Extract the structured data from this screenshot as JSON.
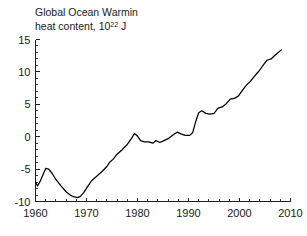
{
  "chart_data": {
    "type": "line",
    "title": "Global Ocean Warmin",
    "subtitle": "heat content, 10",
    "subtitle_exponent": "22",
    "subtitle_unit": " J",
    "xlabel": "",
    "ylabel": "",
    "xlim": [
      1960,
      2010
    ],
    "ylim": [
      -10,
      15
    ],
    "grid": false,
    "legend": null,
    "line_color": "#000000",
    "background_color": "#ffffff",
    "axis_color": "#222222",
    "x_major_ticks": [
      1960,
      1970,
      1980,
      1990,
      2000,
      2010
    ],
    "x_major_tick_labels": [
      "1960",
      "1970",
      "1980",
      "1990",
      "2000",
      "2010"
    ],
    "x_minor_tick_step": 2,
    "y_major_ticks": [
      -10,
      -5,
      0,
      5,
      10,
      15
    ],
    "y_major_tick_labels": [
      "-10",
      "-5",
      "0",
      "5",
      "10",
      "15"
    ],
    "y_minor_tick_step": 1,
    "series": [
      {
        "name": "Global ocean heat content anomaly",
        "x": [
          1960.0,
          1960.4,
          1960.9,
          1961.4,
          1962.0,
          1962.6,
          1963.2,
          1964.0,
          1965.0,
          1966.0,
          1967.0,
          1967.6,
          1968.2,
          1968.8,
          1969.5,
          1970.2,
          1971.0,
          1972.0,
          1973.0,
          1974.0,
          1974.6,
          1975.2,
          1976.0,
          1977.0,
          1978.0,
          1978.8,
          1979.4,
          1980.0,
          1980.6,
          1981.4,
          1982.2,
          1983.0,
          1983.6,
          1984.4,
          1985.2,
          1986.0,
          1987.0,
          1987.8,
          1988.6,
          1989.4,
          1990.2,
          1990.8,
          1991.4,
          1992.0,
          1992.6,
          1993.4,
          1994.2,
          1995.0,
          1995.8,
          1996.6,
          1997.4,
          1998.2,
          1999.0,
          1999.8,
          2000.6,
          2001.4,
          2002.2,
          2003.0,
          2003.8,
          2004.6,
          2005.4,
          2006.2,
          2007.0,
          2007.6,
          2008.2
        ],
        "y": [
          -7.0,
          -7.6,
          -6.9,
          -6.0,
          -4.9,
          -5.0,
          -5.6,
          -6.6,
          -7.6,
          -8.5,
          -9.1,
          -9.3,
          -9.4,
          -9.2,
          -8.6,
          -7.7,
          -6.8,
          -6.1,
          -5.4,
          -4.6,
          -3.9,
          -3.5,
          -2.7,
          -2.0,
          -1.2,
          -0.3,
          0.5,
          0.1,
          -0.6,
          -0.8,
          -0.8,
          -1.0,
          -0.6,
          -0.9,
          -0.6,
          -0.3,
          0.3,
          0.7,
          0.4,
          0.2,
          0.2,
          0.6,
          2.3,
          3.7,
          4.0,
          3.6,
          3.5,
          3.6,
          4.4,
          4.6,
          5.1,
          5.8,
          5.9,
          6.3,
          7.2,
          8.0,
          8.6,
          9.4,
          10.1,
          11.0,
          11.8,
          12.0,
          12.6,
          13.0,
          13.4
        ]
      }
    ]
  },
  "annotations": {
    "title_line1": "Global Ocean Warmin",
    "title_line2_prefix": "heat content, 10",
    "title_line2_exponent": "22",
    "title_line2_suffix": " J"
  }
}
